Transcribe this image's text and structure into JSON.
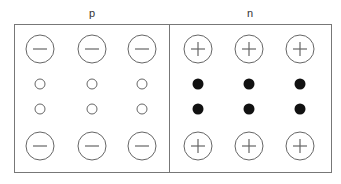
{
  "diagram": {
    "type": "pn-junction",
    "regions": [
      {
        "label": "p",
        "ions": {
          "sign": "−",
          "symbol": "minus-ion",
          "rows": 2,
          "cols": 3
        },
        "carriers": {
          "kind": "hole",
          "style": "hollow",
          "rows": 2,
          "cols": 3
        }
      },
      {
        "label": "n",
        "ions": {
          "sign": "+",
          "symbol": "plus-ion",
          "rows": 2,
          "cols": 3
        },
        "carriers": {
          "kind": "electron",
          "style": "filled",
          "rows": 2,
          "cols": 3
        }
      }
    ],
    "colors": {
      "stroke": "#555555",
      "filled_dot": "#111111",
      "background": "#ffffff"
    }
  }
}
